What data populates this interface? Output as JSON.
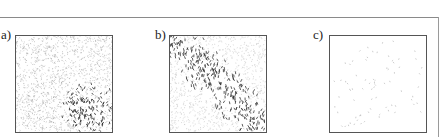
{
  "figure": {
    "panels": [
      {
        "id": "a",
        "label": "a)",
        "description": "dense vector field, uniform light arrows with dark cluster in lower-right",
        "density": "high",
        "cluster": {
          "cx": 0.78,
          "cy": 0.78,
          "r": 0.3
        }
      },
      {
        "id": "b",
        "label": "b)",
        "description": "vector field with dark diagonal band from upper-left to lower-right",
        "density": "medium",
        "cluster": "diagonal-band"
      },
      {
        "id": "c",
        "label": "c)",
        "description": "sparse scattered faint arrows",
        "density": "low",
        "cluster": null
      }
    ]
  }
}
